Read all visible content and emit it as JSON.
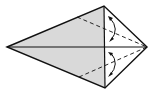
{
  "diagram": {
    "type": "origami-fold-step",
    "colors": {
      "shaded": "#d9d9d9",
      "paper": "#ffffff",
      "line": "#111111"
    },
    "points": {
      "left_tip": [
        7,
        47
      ],
      "top": [
        104,
        6
      ],
      "right_tip": [
        147,
        47
      ],
      "bottom": [
        105,
        88
      ]
    }
  }
}
